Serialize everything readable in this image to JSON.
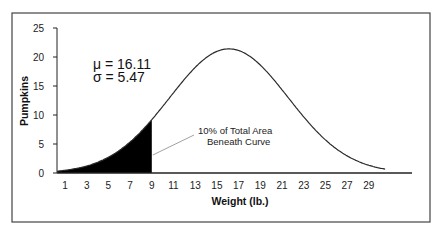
{
  "chart_data": {
    "type": "area",
    "title": "",
    "xlabel": "Weight (lb.)",
    "ylabel": "Pumpkins",
    "xlim": [
      0.3,
      30.5
    ],
    "ylim": [
      0,
      25
    ],
    "x_ticks": [
      1,
      3,
      5,
      7,
      9,
      11,
      13,
      15,
      17,
      19,
      21,
      23,
      25,
      27,
      29
    ],
    "y_ticks": [
      0,
      5,
      10,
      15,
      20,
      25
    ],
    "grid": false,
    "legend": null,
    "distribution": {
      "name": "normal",
      "mean": 16.11,
      "sd": 5.47,
      "peak_height": 21.4
    },
    "series": [
      {
        "name": "Normal curve",
        "x": [
          1,
          3,
          5,
          7,
          9,
          11,
          13,
          15,
          16.11,
          17,
          19,
          21,
          23,
          25,
          27,
          29
        ],
        "values": [
          0.6,
          1.6,
          3.8,
          7.3,
          11.6,
          15.8,
          19.8,
          21.3,
          21.4,
          21.2,
          18.4,
          14.3,
          9.8,
          5.7,
          2.7,
          0.8
        ]
      }
    ],
    "shaded_region": {
      "x_from": 0.3,
      "x_to": 9,
      "fill": "#000000"
    },
    "annotations": [
      {
        "text": "μ = 16.11",
        "x": 4,
        "y": 18.5
      },
      {
        "text": "σ = 5.47",
        "x": 4,
        "y": 16.3
      },
      {
        "text": "10% of Total Area",
        "x": 10.5,
        "y": 6.9
      },
      {
        "text": "Beneath Curve",
        "x": 10.5,
        "y": 5.2
      }
    ]
  },
  "labels": {
    "mu": "μ = 16.11",
    "sigma": "σ = 5.47",
    "note_line1": "10% of Total Area",
    "note_line2": "Beneath Curve",
    "xlabel": "Weight (lb.)",
    "ylabel": "Pumpkins"
  },
  "colors": {
    "curve": "#2a2a2a",
    "fill": "#000000",
    "axis": "#222222",
    "frame": "#444444",
    "leader": "#888888"
  }
}
